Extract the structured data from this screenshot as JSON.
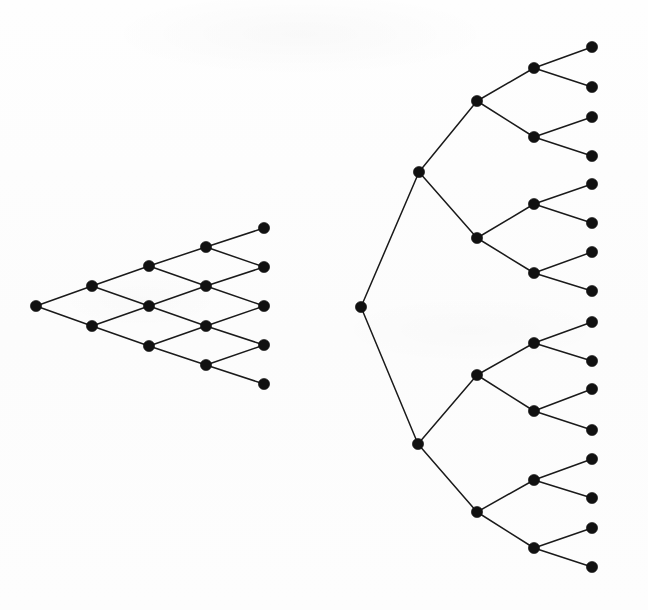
{
  "figure": {
    "background_color": "#fdfdfd",
    "ink_color": "#111111",
    "edge_color": "#1a1a1a",
    "node_radius": 5.6,
    "edge_width": 1.5,
    "width": 648,
    "height": 610
  },
  "diagrams": [
    {
      "id": "recombining-lattice",
      "label": "Recombining binomial lattice",
      "type": "lattice",
      "steps": 4,
      "node_count": 15,
      "edge_count": 20,
      "nodes": [
        {
          "id": "L0_0",
          "step": 0,
          "index": 0,
          "x": 36,
          "y": 306
        },
        {
          "id": "L1_0",
          "step": 1,
          "index": 0,
          "x": 92,
          "y": 286
        },
        {
          "id": "L1_1",
          "step": 1,
          "index": 1,
          "x": 92,
          "y": 326
        },
        {
          "id": "L2_0",
          "step": 2,
          "index": 0,
          "x": 149,
          "y": 266
        },
        {
          "id": "L2_1",
          "step": 2,
          "index": 1,
          "x": 149,
          "y": 306
        },
        {
          "id": "L2_2",
          "step": 2,
          "index": 2,
          "x": 149,
          "y": 346
        },
        {
          "id": "L3_0",
          "step": 3,
          "index": 0,
          "x": 206,
          "y": 247
        },
        {
          "id": "L3_1",
          "step": 3,
          "index": 1,
          "x": 206,
          "y": 286
        },
        {
          "id": "L3_2",
          "step": 3,
          "index": 2,
          "x": 206,
          "y": 326
        },
        {
          "id": "L3_3",
          "step": 3,
          "index": 3,
          "x": 206,
          "y": 365
        },
        {
          "id": "L4_0",
          "step": 4,
          "index": 0,
          "x": 264,
          "y": 228
        },
        {
          "id": "L4_1",
          "step": 4,
          "index": 1,
          "x": 264,
          "y": 267
        },
        {
          "id": "L4_2",
          "step": 4,
          "index": 2,
          "x": 264,
          "y": 306
        },
        {
          "id": "L4_3",
          "step": 4,
          "index": 3,
          "x": 264,
          "y": 345
        },
        {
          "id": "L4_4",
          "step": 4,
          "index": 4,
          "x": 264,
          "y": 384
        }
      ],
      "edges": [
        [
          "L0_0",
          "L1_0"
        ],
        [
          "L0_0",
          "L1_1"
        ],
        [
          "L1_0",
          "L2_0"
        ],
        [
          "L1_0",
          "L2_1"
        ],
        [
          "L1_1",
          "L2_1"
        ],
        [
          "L1_1",
          "L2_2"
        ],
        [
          "L2_0",
          "L3_0"
        ],
        [
          "L2_0",
          "L3_1"
        ],
        [
          "L2_1",
          "L3_1"
        ],
        [
          "L2_1",
          "L3_2"
        ],
        [
          "L2_2",
          "L3_2"
        ],
        [
          "L2_2",
          "L3_3"
        ],
        [
          "L3_0",
          "L4_0"
        ],
        [
          "L3_0",
          "L4_1"
        ],
        [
          "L3_1",
          "L4_1"
        ],
        [
          "L3_1",
          "L4_2"
        ],
        [
          "L3_2",
          "L4_2"
        ],
        [
          "L3_2",
          "L4_3"
        ],
        [
          "L3_3",
          "L4_3"
        ],
        [
          "L3_3",
          "L4_4"
        ]
      ]
    },
    {
      "id": "binary-tree",
      "label": "Non-recombining binary tree",
      "type": "tree",
      "depth": 4,
      "node_count": 31,
      "edge_count": 30,
      "nodes": [
        {
          "id": "T0_0",
          "depth": 0,
          "index": 0,
          "x": 361,
          "y": 307
        },
        {
          "id": "T1_0",
          "depth": 1,
          "index": 0,
          "x": 419,
          "y": 172
        },
        {
          "id": "T1_1",
          "depth": 1,
          "index": 1,
          "x": 418,
          "y": 444
        },
        {
          "id": "T2_0",
          "depth": 2,
          "index": 0,
          "x": 477,
          "y": 101
        },
        {
          "id": "T2_1",
          "depth": 2,
          "index": 1,
          "x": 477,
          "y": 238
        },
        {
          "id": "T2_2",
          "depth": 2,
          "index": 2,
          "x": 477,
          "y": 375
        },
        {
          "id": "T2_3",
          "depth": 2,
          "index": 3,
          "x": 477,
          "y": 512
        },
        {
          "id": "T3_0",
          "depth": 3,
          "index": 0,
          "x": 534,
          "y": 68
        },
        {
          "id": "T3_1",
          "depth": 3,
          "index": 1,
          "x": 534,
          "y": 137
        },
        {
          "id": "T3_2",
          "depth": 3,
          "index": 2,
          "x": 534,
          "y": 204
        },
        {
          "id": "T3_3",
          "depth": 3,
          "index": 3,
          "x": 534,
          "y": 273
        },
        {
          "id": "T3_4",
          "depth": 3,
          "index": 4,
          "x": 534,
          "y": 343
        },
        {
          "id": "T3_5",
          "depth": 3,
          "index": 5,
          "x": 534,
          "y": 411
        },
        {
          "id": "T3_6",
          "depth": 3,
          "index": 6,
          "x": 534,
          "y": 480
        },
        {
          "id": "T3_7",
          "depth": 3,
          "index": 7,
          "x": 534,
          "y": 548
        },
        {
          "id": "T4_0",
          "depth": 4,
          "index": 0,
          "x": 592,
          "y": 47
        },
        {
          "id": "T4_1",
          "depth": 4,
          "index": 1,
          "x": 592,
          "y": 87
        },
        {
          "id": "T4_2",
          "depth": 4,
          "index": 2,
          "x": 592,
          "y": 117
        },
        {
          "id": "T4_3",
          "depth": 4,
          "index": 3,
          "x": 592,
          "y": 156
        },
        {
          "id": "T4_4",
          "depth": 4,
          "index": 4,
          "x": 592,
          "y": 184
        },
        {
          "id": "T4_5",
          "depth": 4,
          "index": 5,
          "x": 592,
          "y": 223
        },
        {
          "id": "T4_6",
          "depth": 4,
          "index": 6,
          "x": 592,
          "y": 252
        },
        {
          "id": "T4_7",
          "depth": 4,
          "index": 7,
          "x": 592,
          "y": 291
        },
        {
          "id": "T4_8",
          "depth": 4,
          "index": 8,
          "x": 592,
          "y": 322
        },
        {
          "id": "T4_9",
          "depth": 4,
          "index": 9,
          "x": 592,
          "y": 361
        },
        {
          "id": "T4_10",
          "depth": 4,
          "index": 10,
          "x": 592,
          "y": 389
        },
        {
          "id": "T4_11",
          "depth": 4,
          "index": 11,
          "x": 592,
          "y": 430
        },
        {
          "id": "T4_12",
          "depth": 4,
          "index": 12,
          "x": 592,
          "y": 459
        },
        {
          "id": "T4_13",
          "depth": 4,
          "index": 13,
          "x": 592,
          "y": 498
        },
        {
          "id": "T4_14",
          "depth": 4,
          "index": 14,
          "x": 592,
          "y": 528
        },
        {
          "id": "T4_15",
          "depth": 4,
          "index": 15,
          "x": 592,
          "y": 567
        }
      ],
      "edges": [
        [
          "T0_0",
          "T1_0"
        ],
        [
          "T0_0",
          "T1_1"
        ],
        [
          "T1_0",
          "T2_0"
        ],
        [
          "T1_0",
          "T2_1"
        ],
        [
          "T1_1",
          "T2_2"
        ],
        [
          "T1_1",
          "T2_3"
        ],
        [
          "T2_0",
          "T3_0"
        ],
        [
          "T2_0",
          "T3_1"
        ],
        [
          "T2_1",
          "T3_2"
        ],
        [
          "T2_1",
          "T3_3"
        ],
        [
          "T2_2",
          "T3_4"
        ],
        [
          "T2_2",
          "T3_5"
        ],
        [
          "T2_3",
          "T3_6"
        ],
        [
          "T2_3",
          "T3_7"
        ],
        [
          "T3_0",
          "T4_0"
        ],
        [
          "T3_0",
          "T4_1"
        ],
        [
          "T3_1",
          "T4_2"
        ],
        [
          "T3_1",
          "T4_3"
        ],
        [
          "T3_2",
          "T4_4"
        ],
        [
          "T3_2",
          "T4_5"
        ],
        [
          "T3_3",
          "T4_6"
        ],
        [
          "T3_3",
          "T4_7"
        ],
        [
          "T3_4",
          "T4_8"
        ],
        [
          "T3_4",
          "T4_9"
        ],
        [
          "T3_5",
          "T4_10"
        ],
        [
          "T3_5",
          "T4_11"
        ],
        [
          "T3_6",
          "T4_12"
        ],
        [
          "T3_6",
          "T4_13"
        ],
        [
          "T3_7",
          "T4_14"
        ],
        [
          "T3_7",
          "T4_15"
        ]
      ]
    }
  ]
}
